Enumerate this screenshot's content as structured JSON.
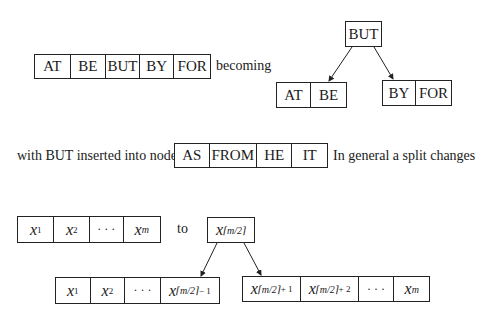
{
  "example": {
    "before_node": [
      "AT",
      "BE",
      "BUT",
      "BY",
      "FOR"
    ],
    "becoming_label": "becoming",
    "root": "BUT",
    "left_child": [
      "AT",
      "BE"
    ],
    "right_child": [
      "BY",
      "FOR"
    ],
    "caption_prefix": "with BUT inserted into node",
    "target_node": [
      "AS",
      "FROM",
      "HE",
      "IT"
    ],
    "caption_suffix": "In general a split changes"
  },
  "general": {
    "before_node": [
      {
        "base": "x",
        "sub": "1"
      },
      {
        "base": "x",
        "sub": "2"
      },
      {
        "base": "· · ·",
        "sub": ""
      },
      {
        "base": "x",
        "sub": "m"
      }
    ],
    "to_label": "to",
    "root": {
      "base": "x",
      "sub": "⌈m/2⌉"
    },
    "left_child": [
      {
        "base": "x",
        "sub": "1"
      },
      {
        "base": "x",
        "sub": "2"
      },
      {
        "base": "· · ·",
        "sub": ""
      },
      {
        "base": "x",
        "sub": "⌈m/2⌉",
        "suffix": " − 1"
      }
    ],
    "right_child": [
      {
        "base": "x",
        "sub": "⌈m/2⌉",
        "suffix": " + 1"
      },
      {
        "base": "x",
        "sub": "⌈m/2⌉",
        "suffix": " + 2"
      },
      {
        "base": "· · ·",
        "sub": ""
      },
      {
        "base": "x",
        "sub": "m"
      }
    ]
  }
}
